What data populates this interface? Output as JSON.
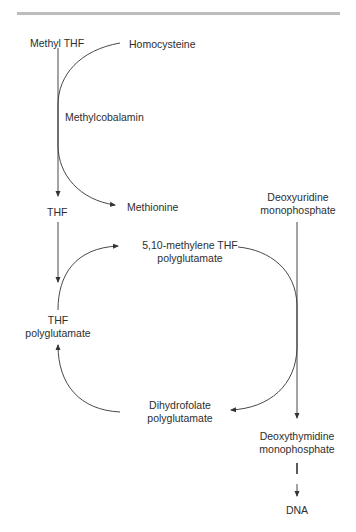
{
  "diagram": {
    "type": "metabolic-pathway",
    "nodes": {
      "methyl_thf": "Methyl THF",
      "homocysteine": "Homocysteine",
      "methylcobalamin": "Methylcobalamin",
      "methionine": "Methionine",
      "thf": "THF",
      "methylene_thf_l1": "5,10-methylene THF",
      "methylene_thf_l2": "polyglutamate",
      "thf_poly_l1": "THF",
      "thf_poly_l2": "polyglutamate",
      "dihydrofolate_l1": "Dihydrofolate",
      "dihydrofolate_l2": "polyglutamate",
      "dump_l1": "Deoxyuridine",
      "dump_l2": "monophosphate",
      "dtmp_l1": "Deoxythymidine",
      "dtmp_l2": "monophosphate",
      "dna": "DNA"
    },
    "edges": [
      {
        "from": "Methyl THF",
        "to": "THF"
      },
      {
        "from": "Homocysteine",
        "to": "Methionine",
        "via": "Methylcobalamin"
      },
      {
        "from": "THF",
        "to": "THF polyglutamate"
      },
      {
        "from": "THF polyglutamate",
        "to": "5,10-methylene THF polyglutamate"
      },
      {
        "from": "5,10-methylene THF polyglutamate",
        "to": "Dihydrofolate polyglutamate"
      },
      {
        "from": "Dihydrofolate polyglutamate",
        "to": "THF polyglutamate"
      },
      {
        "from": "Deoxyuridine monophosphate",
        "to": "Deoxythymidine monophosphate"
      },
      {
        "from": "Deoxythymidine monophosphate",
        "to": "DNA"
      }
    ],
    "colors": {
      "line": "#333333",
      "rule": "#bdbdbd",
      "text": "#2e2e2e"
    }
  }
}
